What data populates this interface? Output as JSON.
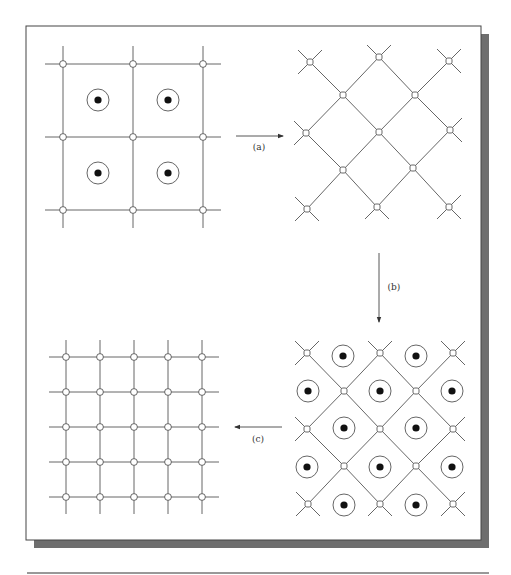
{
  "figure": {
    "width": 511,
    "height": 575,
    "colors": {
      "line": "#555555",
      "frame": "#444444",
      "shadow": "#6e6e6e",
      "dot": "#111111",
      "background": "#ffffff"
    },
    "frame": {
      "x": 26,
      "y": 26,
      "w": 455,
      "h": 514,
      "shadow_offset": 8
    },
    "bottom_rule": {
      "x1": 27,
      "x2": 489,
      "y": 573
    }
  },
  "panels": [
    {
      "id": "panel-square-lattice",
      "type": "square-grid",
      "xs": [
        63,
        133,
        203
      ],
      "ys": [
        64,
        137,
        210
      ],
      "overhang": 18,
      "node_radius": 3.4,
      "dotted_circles": [
        [
          98,
          100
        ],
        [
          168,
          100
        ],
        [
          98,
          173
        ],
        [
          168,
          173
        ]
      ]
    },
    {
      "id": "panel-diamond-lattice",
      "type": "diamond",
      "nodes": [
        [
          310,
          62
        ],
        [
          379,
          57
        ],
        [
          449,
          61
        ],
        [
          343,
          95
        ],
        [
          415,
          95
        ],
        [
          306,
          133
        ],
        [
          379,
          132
        ],
        [
          450,
          130
        ],
        [
          343,
          170
        ],
        [
          413,
          168
        ],
        [
          307,
          209
        ],
        [
          377,
          207
        ],
        [
          449,
          207
        ]
      ],
      "edges": [
        [
          0,
          3
        ],
        [
          1,
          3
        ],
        [
          1,
          4
        ],
        [
          2,
          4
        ],
        [
          3,
          5
        ],
        [
          3,
          6
        ],
        [
          4,
          6
        ],
        [
          4,
          7
        ],
        [
          5,
          8
        ],
        [
          6,
          8
        ],
        [
          6,
          9
        ],
        [
          7,
          9
        ],
        [
          8,
          10
        ],
        [
          8,
          11
        ],
        [
          9,
          11
        ],
        [
          9,
          12
        ]
      ],
      "stubs": [
        [
          310,
          62,
          -12,
          -12
        ],
        [
          310,
          62,
          12,
          -12
        ],
        [
          310,
          62,
          -12,
          12
        ],
        [
          379,
          57,
          -12,
          -12
        ],
        [
          379,
          57,
          12,
          -12
        ],
        [
          449,
          61,
          -12,
          -12
        ],
        [
          449,
          61,
          12,
          -12
        ],
        [
          449,
          61,
          12,
          12
        ],
        [
          306,
          133,
          -12,
          -12
        ],
        [
          306,
          133,
          -12,
          12
        ],
        [
          450,
          130,
          12,
          -12
        ],
        [
          450,
          130,
          12,
          12
        ],
        [
          307,
          209,
          -12,
          -12
        ],
        [
          307,
          209,
          -12,
          12
        ],
        [
          307,
          209,
          12,
          12
        ],
        [
          377,
          207,
          -12,
          12
        ],
        [
          377,
          207,
          12,
          12
        ],
        [
          449,
          207,
          -12,
          12
        ],
        [
          449,
          207,
          12,
          12
        ],
        [
          449,
          207,
          12,
          -12
        ]
      ],
      "node_size": 6,
      "dotted_circles": []
    },
    {
      "id": "panel-diamond-with-atoms",
      "type": "diamond",
      "nodes": [
        [
          307,
          353
        ],
        [
          380,
          353
        ],
        [
          453,
          353
        ],
        [
          344,
          391
        ],
        [
          416,
          391
        ],
        [
          307,
          429
        ],
        [
          380,
          429
        ],
        [
          453,
          429
        ],
        [
          344,
          466
        ],
        [
          416,
          466
        ],
        [
          308,
          504
        ],
        [
          380,
          504
        ],
        [
          453,
          504
        ]
      ],
      "edges": [
        [
          0,
          3
        ],
        [
          1,
          3
        ],
        [
          1,
          4
        ],
        [
          2,
          4
        ],
        [
          3,
          5
        ],
        [
          3,
          6
        ],
        [
          4,
          6
        ],
        [
          4,
          7
        ],
        [
          5,
          8
        ],
        [
          6,
          8
        ],
        [
          6,
          9
        ],
        [
          7,
          9
        ],
        [
          8,
          10
        ],
        [
          8,
          11
        ],
        [
          9,
          11
        ],
        [
          9,
          12
        ]
      ],
      "stubs": [
        [
          307,
          353,
          -12,
          -12
        ],
        [
          307,
          353,
          12,
          -12
        ],
        [
          307,
          353,
          -12,
          12
        ],
        [
          380,
          353,
          -12,
          -12
        ],
        [
          380,
          353,
          12,
          -12
        ],
        [
          453,
          353,
          -12,
          -12
        ],
        [
          453,
          353,
          12,
          -12
        ],
        [
          453,
          353,
          12,
          12
        ],
        [
          307,
          429,
          -12,
          -12
        ],
        [
          307,
          429,
          -12,
          12
        ],
        [
          453,
          429,
          12,
          -12
        ],
        [
          453,
          429,
          12,
          12
        ],
        [
          308,
          504,
          -12,
          -12
        ],
        [
          308,
          504,
          -12,
          12
        ],
        [
          308,
          504,
          12,
          12
        ],
        [
          380,
          504,
          -12,
          12
        ],
        [
          380,
          504,
          12,
          12
        ],
        [
          453,
          504,
          -12,
          12
        ],
        [
          453,
          504,
          12,
          12
        ],
        [
          453,
          504,
          12,
          -12
        ]
      ],
      "node_size": 6,
      "dotted_circles": [
        [
          343,
          356
        ],
        [
          416,
          356
        ],
        [
          308,
          391
        ],
        [
          380,
          391
        ],
        [
          452,
          391
        ],
        [
          344,
          428
        ],
        [
          416,
          428
        ],
        [
          307,
          467
        ],
        [
          380,
          467
        ],
        [
          452,
          467
        ],
        [
          344,
          505
        ],
        [
          416,
          505
        ]
      ]
    },
    {
      "id": "panel-fine-square-lattice",
      "type": "square-grid",
      "xs": [
        66,
        100,
        134,
        168,
        202
      ],
      "ys": [
        357,
        392,
        427,
        462,
        497
      ],
      "overhang": 17,
      "node_radius": 3.4,
      "dotted_circles": []
    }
  ],
  "arrows": [
    {
      "id": "arrow-a",
      "label": "(a)",
      "x1": 236,
      "y1": 136,
      "x2": 283,
      "y2": 136,
      "lx": 259,
      "ly": 150
    },
    {
      "id": "arrow-b",
      "label": "(b)",
      "x1": 379,
      "y1": 253,
      "x2": 379,
      "y2": 322,
      "lx": 394,
      "ly": 290
    },
    {
      "id": "arrow-c",
      "label": "(c)",
      "x1": 282,
      "y1": 427,
      "x2": 235,
      "y2": 427,
      "lx": 258,
      "ly": 442
    }
  ],
  "atom": {
    "outer_radius": 11,
    "inner_radius": 3.6
  }
}
